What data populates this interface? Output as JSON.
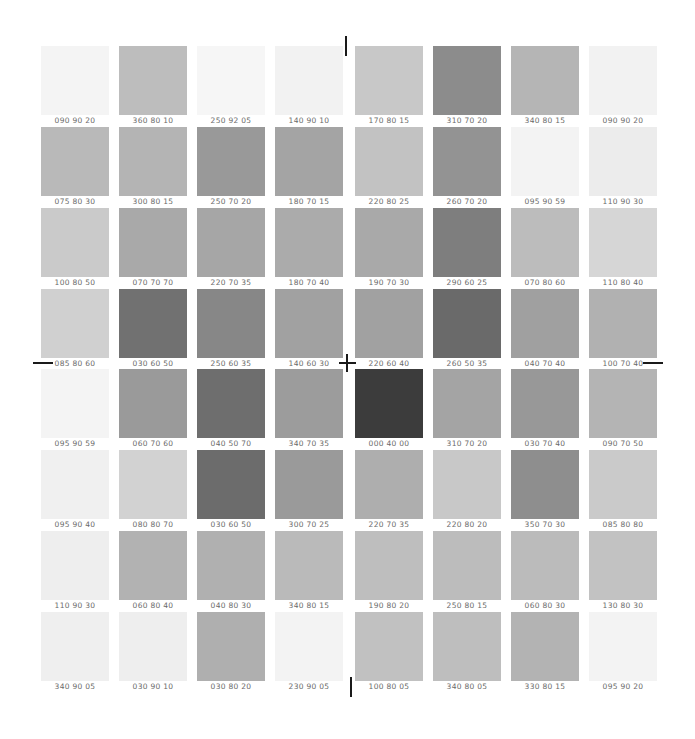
{
  "chart_data": {
    "type": "table",
    "title": "",
    "columns": 8,
    "rows": 8,
    "cells": [
      [
        "090 90 20",
        "360 80 10",
        "250 92 05",
        "140 90 10",
        "170 80 15",
        "310 70 20",
        "340 80 15",
        "090 90 20"
      ],
      [
        "075 80 30",
        "300 80 15",
        "250 70 20",
        "180 70 15",
        "220 80 25",
        "260 70 20",
        "095 90 59",
        "110 90 30"
      ],
      [
        "100 80 50",
        "070 70 70",
        "220 70 35",
        "180 70 40",
        "190 70 30",
        "290 60 25",
        "070 80 60",
        "110 80 40"
      ],
      [
        "085 80 60",
        "030 60 50",
        "250 60 35",
        "140 60 30",
        "220 60 40",
        "260 50 35",
        "040 70 40",
        "100 70 40"
      ],
      [
        "095 90 59",
        "060 70 60",
        "040 50 70",
        "340 70 35",
        "000 40 00",
        "310 70 20",
        "030 70 40",
        "090 70 50"
      ],
      [
        "095 90 40",
        "080 80 70",
        "030 60 50",
        "300 70 25",
        "220 70 35",
        "220 80 20",
        "350 70 30",
        "085 80 80"
      ],
      [
        "110 90 30",
        "060 80 40",
        "040 80 30",
        "340 80 15",
        "190 80 20",
        "250 80 15",
        "060 80 30",
        "130 80 30"
      ],
      [
        "340 90 05",
        "030 90 10",
        "030 80 20",
        "230 90 05",
        "100 80 05",
        "340 80 05",
        "330 80 15",
        "095 90 20"
      ]
    ]
  },
  "swatch_colors": [
    [
      "#f4f4f4",
      "#bdbdbd",
      "#f6f6f6",
      "#f2f2f2",
      "#c8c8c8",
      "#8c8c8c",
      "#b5b5b5",
      "#f2f2f2"
    ],
    [
      "#b9b9b9",
      "#b4b4b4",
      "#999999",
      "#a4a4a4",
      "#c2c2c2",
      "#939393",
      "#f3f3f3",
      "#ececec"
    ],
    [
      "#cacaca",
      "#a9a9a9",
      "#a6a6a6",
      "#ababab",
      "#a9a9a9",
      "#7e7e7e",
      "#bcbcbc",
      "#d6d6d6"
    ],
    [
      "#d0d0d0",
      "#717171",
      "#878787",
      "#a1a1a1",
      "#a1a1a1",
      "#6a6a6a",
      "#a0a0a0",
      "#b1b1b1"
    ],
    [
      "#f4f4f4",
      "#9a9a9a",
      "#6e6e6e",
      "#9c9c9c",
      "#3c3c3c",
      "#a4a4a4",
      "#989898",
      "#b4b4b4"
    ],
    [
      "#f0f0f0",
      "#d2d2d2",
      "#6c6c6c",
      "#9a9a9a",
      "#aeaeae",
      "#c8c8c8",
      "#8e8e8e",
      "#cacaca"
    ],
    [
      "#eeeeee",
      "#b2b2b2",
      "#b0b0b0",
      "#bababa",
      "#bebebe",
      "#bcbcbc",
      "#bbbbbb",
      "#c2c2c2"
    ],
    [
      "#efefef",
      "#eeeeee",
      "#afafaf",
      "#f3f3f3",
      "#c1c1c1",
      "#bebebe",
      "#b3b3b3",
      "#f3f3f3"
    ]
  ],
  "registration_marks": [
    "top-vertical",
    "left-horizontal",
    "center-cross",
    "right-horizontal",
    "bottom-vertical"
  ]
}
